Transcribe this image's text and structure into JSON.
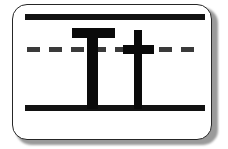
{
  "card": {
    "type": "handwriting-practice-flashcard",
    "letters_shown": "Tt",
    "uppercase_letter": "T",
    "lowercase_letter": "t",
    "background_color": "#ffffff",
    "border_color": "#262626",
    "ink_color": "#0a0a0a",
    "shadow_color": "#9a9a9a"
  },
  "ruling": {
    "top_line": {
      "name": "top-solid-rule",
      "style": "solid",
      "color": "#121212"
    },
    "mid_line": {
      "name": "middle-dashed-rule",
      "style": "dashed",
      "color": "#3a3a3a"
    },
    "baseline": {
      "name": "baseline-solid-rule",
      "style": "solid",
      "color": "#121212"
    }
  },
  "glyphs": {
    "uppercase": {
      "label": "T",
      "crossbar_name": "uppercase-t-crossbar",
      "stem_name": "uppercase-t-stem"
    },
    "lowercase": {
      "label": "t",
      "crossbar_name": "lowercase-t-crossbar",
      "stem_name": "lowercase-t-stem"
    }
  }
}
